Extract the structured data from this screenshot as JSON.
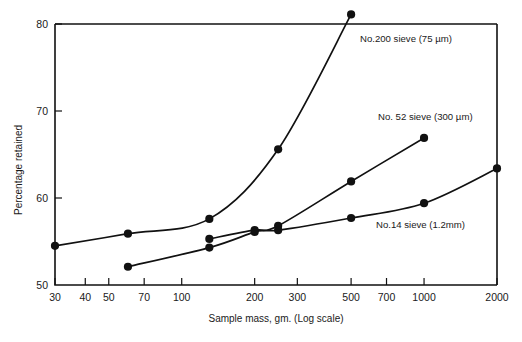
{
  "chart_data": {
    "type": "line",
    "title": "",
    "xlabel": "Sample mass, gm. (Log scale)",
    "ylabel": "Percentage retained",
    "xscale": "log",
    "xlim": [
      30,
      2000
    ],
    "ylim": [
      50,
      80
    ],
    "grid": false,
    "legend_position": "inline-right",
    "xticks": [
      30,
      40,
      50,
      70,
      100,
      200,
      300,
      500,
      700,
      1000,
      2000
    ],
    "xtick_labels": [
      "30",
      "40",
      "50",
      "70",
      "100",
      "200",
      "300",
      "500",
      "700",
      "1000",
      "2000"
    ],
    "yticks": [
      50,
      60,
      70,
      80
    ],
    "ytick_labels": [
      "50",
      "60",
      "70",
      "80"
    ],
    "series": [
      {
        "name": "No.200 sieve (75 µm)",
        "label": "No.200 sieve (75 µm)",
        "label_x": 360,
        "label_y": 42,
        "points": [
          {
            "x": 30,
            "y": 54.5
          },
          {
            "x": 60,
            "y": 55.9
          },
          {
            "x": 130,
            "y": 57.6
          },
          {
            "x": 250,
            "y": 65.6
          },
          {
            "x": 500,
            "y": 81.1
          }
        ]
      },
      {
        "name": "No. 52 sieve (300 µm)",
        "label": "No. 52 sieve (300 µm)",
        "label_x": 378,
        "label_y": 120,
        "points": [
          {
            "x": 60,
            "y": 52.1
          },
          {
            "x": 130,
            "y": 54.3
          },
          {
            "x": 200,
            "y": 56.1
          },
          {
            "x": 250,
            "y": 56.8
          },
          {
            "x": 500,
            "y": 61.9
          },
          {
            "x": 1000,
            "y": 66.9
          }
        ]
      },
      {
        "name": "No.14 sieve (1.2mm)",
        "label": "No.14 sieve (1.2mm)",
        "label_x": 376,
        "label_y": 228,
        "points": [
          {
            "x": 130,
            "y": 55.3
          },
          {
            "x": 200,
            "y": 56.3
          },
          {
            "x": 250,
            "y": 56.3
          },
          {
            "x": 500,
            "y": 57.7
          },
          {
            "x": 1000,
            "y": 59.4
          },
          {
            "x": 2000,
            "y": 63.4
          }
        ]
      }
    ]
  },
  "axes": {
    "x_title": "Sample mass, gm. (Log scale)",
    "y_title": "Percentage retained"
  }
}
